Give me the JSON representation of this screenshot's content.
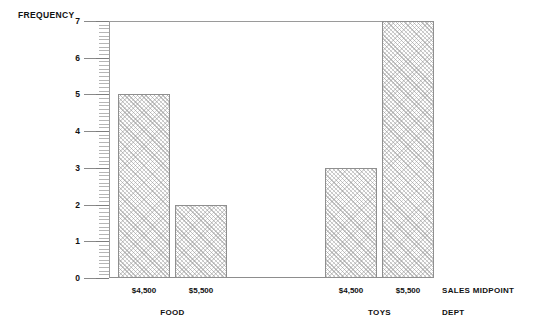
{
  "chart_data": {
    "type": "bar",
    "title": "",
    "xlabel": "SALES MIDPOINT",
    "xlabel2": "DEPT",
    "ylabel": "FREQUENCY",
    "ylim": [
      0,
      7
    ],
    "ytick_labels": [
      "7",
      "6",
      "5",
      "4",
      "3",
      "2",
      "1",
      "0"
    ],
    "ytick_values": [
      7,
      6,
      5,
      4,
      3,
      2,
      1,
      0
    ],
    "minor_ticks_per_unit": 10,
    "grid": false,
    "legend": "none",
    "categories": [
      "$4,500",
      "$5,500"
    ],
    "groups": [
      {
        "name": "FOOD",
        "categories": [
          "$4,500",
          "$5,500"
        ],
        "values": [
          5,
          2
        ]
      },
      {
        "name": "TOYS",
        "categories": [
          "$4,500",
          "$5,500"
        ],
        "values": [
          3,
          7
        ]
      }
    ],
    "bars": [
      {
        "group": "FOOD",
        "category": "$4,500",
        "value": 5
      },
      {
        "group": "FOOD",
        "category": "$5,500",
        "value": 2
      },
      {
        "group": "TOYS",
        "category": "$4,500",
        "value": 3
      },
      {
        "group": "TOYS",
        "category": "$5,500",
        "value": 7
      }
    ],
    "bar_fill": "#fefefe",
    "bar_pattern": "diagonal-crosshatch",
    "bar_edge_color": "#8f8f8f",
    "axis_color": "#9a9a9a",
    "background": "#ffffff"
  }
}
